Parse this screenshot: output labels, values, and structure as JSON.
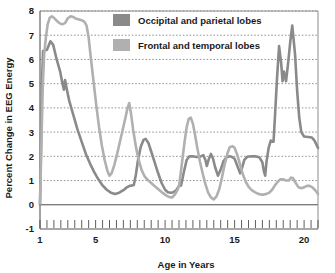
{
  "chart_data": {
    "type": "line",
    "title": "",
    "xlabel": "Age in Years",
    "ylabel": "Percent Change in EEG Energy",
    "xlim": [
      1,
      21
    ],
    "ylim": [
      -1,
      8
    ],
    "yticks": [
      "-1",
      "0",
      "1",
      "2",
      "3",
      "4",
      "5",
      "6",
      "7",
      "8"
    ],
    "ytick_values": [
      -1,
      0,
      1,
      2,
      3,
      4,
      5,
      6,
      7,
      8
    ],
    "xticks": [
      "1",
      "5",
      "10",
      "15",
      "20"
    ],
    "xtick_values": [
      1,
      5,
      10,
      15,
      20
    ],
    "minor_tick_step": 0.5,
    "grid": "horizontal-dotted",
    "zero_line": true,
    "legend_position": "top-center",
    "series": [
      {
        "name": "Occipital and parietal lobes",
        "color": "#8a8a8a",
        "points": [
          [
            1.0,
            0.0
          ],
          [
            1.05,
            1.6
          ],
          [
            1.1,
            3.4
          ],
          [
            1.15,
            5.2
          ],
          [
            1.22,
            6.35
          ],
          [
            1.5,
            6.4
          ],
          [
            1.75,
            6.75
          ],
          [
            1.95,
            6.6
          ],
          [
            2.2,
            6.0
          ],
          [
            2.45,
            5.5
          ],
          [
            2.6,
            5.05
          ],
          [
            2.72,
            4.75
          ],
          [
            2.8,
            5.15
          ],
          [
            2.9,
            4.85
          ],
          [
            3.1,
            4.3
          ],
          [
            3.4,
            3.7
          ],
          [
            3.7,
            3.1
          ],
          [
            4.0,
            2.6
          ],
          [
            4.3,
            2.1
          ],
          [
            4.6,
            1.7
          ],
          [
            4.9,
            1.35
          ],
          [
            5.2,
            1.05
          ],
          [
            5.5,
            0.8
          ],
          [
            5.8,
            0.62
          ],
          [
            6.1,
            0.5
          ],
          [
            6.4,
            0.45
          ],
          [
            6.7,
            0.5
          ],
          [
            7.0,
            0.6
          ],
          [
            7.25,
            0.72
          ],
          [
            7.45,
            0.78
          ],
          [
            7.6,
            0.8
          ],
          [
            7.75,
            0.82
          ],
          [
            7.9,
            1.25
          ],
          [
            8.05,
            1.85
          ],
          [
            8.25,
            2.4
          ],
          [
            8.45,
            2.68
          ],
          [
            8.6,
            2.72
          ],
          [
            8.8,
            2.55
          ],
          [
            9.0,
            2.2
          ],
          [
            9.25,
            1.75
          ],
          [
            9.5,
            1.3
          ],
          [
            9.75,
            0.9
          ],
          [
            10.0,
            0.62
          ],
          [
            10.2,
            0.52
          ],
          [
            10.4,
            0.5
          ],
          [
            10.6,
            0.52
          ],
          [
            10.8,
            0.6
          ],
          [
            11.0,
            0.78
          ],
          [
            11.15,
            0.8
          ],
          [
            11.35,
            1.35
          ],
          [
            11.55,
            1.85
          ],
          [
            11.75,
            2.0
          ],
          [
            12.0,
            2.0
          ],
          [
            12.25,
            1.97
          ],
          [
            12.5,
            1.98
          ],
          [
            12.75,
            2.05
          ],
          [
            12.9,
            1.85
          ],
          [
            13.0,
            1.6
          ],
          [
            13.15,
            1.9
          ],
          [
            13.3,
            2.1
          ],
          [
            13.45,
            1.9
          ],
          [
            13.6,
            1.55
          ],
          [
            13.8,
            1.2
          ],
          [
            14.0,
            1.45
          ],
          [
            14.2,
            1.8
          ],
          [
            14.4,
            1.95
          ],
          [
            14.6,
            2.0
          ],
          [
            14.8,
            1.98
          ],
          [
            15.0,
            1.9
          ],
          [
            15.2,
            1.6
          ],
          [
            15.4,
            1.3
          ],
          [
            15.55,
            1.55
          ],
          [
            15.7,
            1.85
          ],
          [
            15.9,
            1.98
          ],
          [
            16.2,
            2.0
          ],
          [
            16.5,
            2.0
          ],
          [
            16.8,
            1.95
          ],
          [
            17.0,
            1.75
          ],
          [
            17.1,
            1.4
          ],
          [
            17.2,
            1.2
          ],
          [
            17.3,
            1.8
          ],
          [
            17.45,
            2.35
          ],
          [
            17.6,
            2.65
          ],
          [
            17.7,
            2.6
          ],
          [
            17.8,
            2.6
          ],
          [
            17.9,
            3.6
          ],
          [
            18.05,
            5.2
          ],
          [
            18.2,
            6.55
          ],
          [
            18.35,
            5.85
          ],
          [
            18.45,
            5.1
          ],
          [
            18.55,
            5.5
          ],
          [
            18.7,
            5.1
          ],
          [
            18.85,
            5.85
          ],
          [
            19.0,
            6.7
          ],
          [
            19.15,
            7.4
          ],
          [
            19.35,
            6.2
          ],
          [
            19.5,
            4.7
          ],
          [
            19.65,
            3.6
          ],
          [
            19.8,
            3.0
          ],
          [
            20.0,
            2.82
          ],
          [
            20.3,
            2.8
          ],
          [
            20.55,
            2.78
          ],
          [
            20.75,
            2.65
          ],
          [
            21.0,
            2.35
          ]
        ]
      },
      {
        "name": "Frontal and temporal lobes",
        "color": "#b0b0b0",
        "points": [
          [
            1.0,
            0.05
          ],
          [
            1.05,
            1.2
          ],
          [
            1.12,
            3.0
          ],
          [
            1.2,
            4.9
          ],
          [
            1.3,
            6.2
          ],
          [
            1.42,
            6.9
          ],
          [
            1.55,
            7.45
          ],
          [
            1.7,
            7.72
          ],
          [
            1.85,
            7.78
          ],
          [
            2.0,
            7.72
          ],
          [
            2.2,
            7.6
          ],
          [
            2.4,
            7.5
          ],
          [
            2.6,
            7.45
          ],
          [
            2.8,
            7.5
          ],
          [
            3.0,
            7.7
          ],
          [
            3.2,
            7.78
          ],
          [
            3.4,
            7.75
          ],
          [
            3.6,
            7.68
          ],
          [
            3.8,
            7.65
          ],
          [
            4.0,
            7.62
          ],
          [
            4.2,
            7.55
          ],
          [
            4.35,
            7.4
          ],
          [
            4.5,
            6.9
          ],
          [
            4.65,
            6.1
          ],
          [
            4.85,
            5.1
          ],
          [
            5.05,
            4.1
          ],
          [
            5.25,
            3.2
          ],
          [
            5.45,
            2.45
          ],
          [
            5.65,
            1.85
          ],
          [
            5.85,
            1.4
          ],
          [
            6.0,
            1.2
          ],
          [
            6.15,
            1.3
          ],
          [
            6.35,
            1.65
          ],
          [
            6.55,
            2.1
          ],
          [
            6.75,
            2.6
          ],
          [
            6.95,
            3.1
          ],
          [
            7.15,
            3.6
          ],
          [
            7.3,
            4.0
          ],
          [
            7.42,
            4.2
          ],
          [
            7.55,
            3.75
          ],
          [
            7.7,
            3.1
          ],
          [
            7.9,
            2.4
          ],
          [
            8.1,
            1.85
          ],
          [
            8.3,
            1.45
          ],
          [
            8.5,
            1.2
          ],
          [
            8.7,
            1.05
          ],
          [
            8.9,
            0.95
          ],
          [
            9.1,
            0.85
          ],
          [
            9.35,
            0.72
          ],
          [
            9.6,
            0.6
          ],
          [
            9.85,
            0.48
          ],
          [
            10.1,
            0.38
          ],
          [
            10.3,
            0.32
          ],
          [
            10.5,
            0.3
          ],
          [
            10.7,
            0.42
          ],
          [
            10.9,
            0.62
          ],
          [
            11.0,
            0.78
          ],
          [
            11.1,
            1.2
          ],
          [
            11.25,
            1.9
          ],
          [
            11.4,
            2.6
          ],
          [
            11.55,
            3.2
          ],
          [
            11.7,
            3.55
          ],
          [
            11.85,
            3.6
          ],
          [
            12.0,
            3.35
          ],
          [
            12.15,
            2.9
          ],
          [
            12.3,
            2.4
          ],
          [
            12.5,
            1.8
          ],
          [
            12.7,
            1.3
          ],
          [
            12.9,
            0.85
          ],
          [
            13.1,
            0.5
          ],
          [
            13.3,
            0.3
          ],
          [
            13.5,
            0.22
          ],
          [
            13.7,
            0.35
          ],
          [
            13.9,
            0.65
          ],
          [
            14.1,
            1.15
          ],
          [
            14.3,
            1.7
          ],
          [
            14.5,
            2.15
          ],
          [
            14.65,
            2.38
          ],
          [
            14.85,
            2.42
          ],
          [
            15.0,
            2.35
          ],
          [
            15.2,
            2.05
          ],
          [
            15.4,
            1.65
          ],
          [
            15.6,
            1.25
          ],
          [
            15.8,
            0.95
          ],
          [
            16.0,
            0.75
          ],
          [
            16.2,
            0.62
          ],
          [
            16.45,
            0.52
          ],
          [
            16.7,
            0.45
          ],
          [
            16.9,
            0.42
          ],
          [
            17.1,
            0.42
          ],
          [
            17.3,
            0.45
          ],
          [
            17.5,
            0.5
          ],
          [
            17.7,
            0.62
          ],
          [
            17.9,
            0.8
          ],
          [
            18.1,
            0.95
          ],
          [
            18.3,
            1.05
          ],
          [
            18.5,
            1.05
          ],
          [
            18.7,
            1.0
          ],
          [
            18.9,
            1.0
          ],
          [
            19.05,
            1.12
          ],
          [
            19.2,
            1.1
          ],
          [
            19.4,
            0.9
          ],
          [
            19.6,
            0.72
          ],
          [
            19.8,
            0.68
          ],
          [
            20.0,
            0.72
          ],
          [
            20.2,
            0.78
          ],
          [
            20.4,
            0.78
          ],
          [
            20.6,
            0.72
          ],
          [
            20.8,
            0.6
          ],
          [
            21.0,
            0.45
          ]
        ]
      }
    ],
    "legend": [
      {
        "label": "Occipital and parietal lobes",
        "color": "#8a8a8a"
      },
      {
        "label": "Frontal and temporal lobes",
        "color": "#b0b0b0"
      }
    ]
  }
}
